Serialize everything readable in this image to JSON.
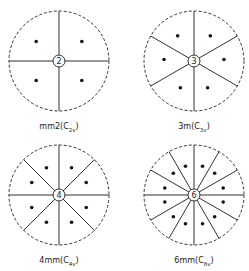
{
  "panels": [
    {
      "id": "mm2",
      "symbol": "mm2",
      "schoenflies_base": "C",
      "schoenflies_sub": "2v",
      "axis_label": "2",
      "order": 2,
      "mirrors": 2,
      "points": 4,
      "cx": 59,
      "cy": 61,
      "label_y": 122
    },
    {
      "id": "3m",
      "symbol": "3m",
      "schoenflies_base": "C",
      "schoenflies_sub": "3v",
      "axis_label": "3",
      "order": 3,
      "mirrors": 3,
      "points": 6,
      "cx": 194,
      "cy": 61,
      "label_y": 122
    },
    {
      "id": "4mm",
      "symbol": "4mm",
      "schoenflies_base": "C",
      "schoenflies_sub": "4v",
      "axis_label": "4",
      "order": 4,
      "mirrors": 4,
      "points": 8,
      "cx": 59,
      "cy": 195,
      "label_y": 256
    },
    {
      "id": "6mm",
      "symbol": "6mm",
      "schoenflies_base": "C",
      "schoenflies_sub": "6v",
      "axis_label": "6",
      "order": 6,
      "mirrors": 6,
      "points": 12,
      "cx": 194,
      "cy": 195,
      "label_y": 256
    }
  ],
  "style": {
    "line_color": "#333333",
    "point_color": "#111111",
    "radius": 50
  }
}
